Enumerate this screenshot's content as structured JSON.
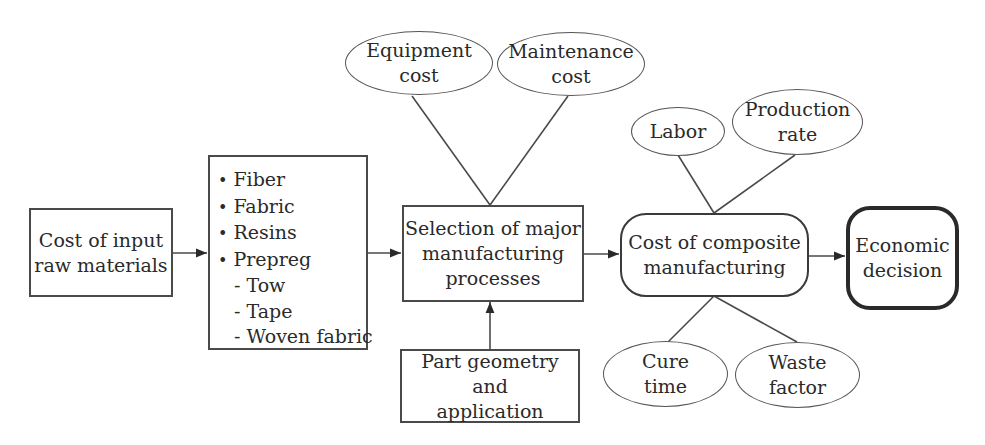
{
  "diagram": {
    "nodes": {
      "input_materials": {
        "lines": [
          "Cost of input",
          "raw materials"
        ]
      },
      "material_types": {
        "items": [
          {
            "label": "Fiber",
            "level": 1
          },
          {
            "label": "Fabric",
            "level": 1
          },
          {
            "label": "Resins",
            "level": 1
          },
          {
            "label": "Prepreg",
            "level": 1
          },
          {
            "label": "- Tow",
            "level": 2
          },
          {
            "label": "- Tape",
            "level": 2
          },
          {
            "label": "- Woven fabric",
            "level": 2
          }
        ]
      },
      "process_selection": {
        "lines": [
          "Selection of major",
          "manufacturing",
          "processes"
        ]
      },
      "equipment_cost": {
        "lines": [
          "Equipment",
          "cost"
        ]
      },
      "maintenance_cost": {
        "lines": [
          "Maintenance",
          "cost"
        ]
      },
      "part_geometry": {
        "lines": [
          "Part geometry and",
          "application"
        ]
      },
      "composite_cost": {
        "lines": [
          "Cost of composite",
          "manufacturing"
        ]
      },
      "labor": {
        "lines": [
          "Labor"
        ]
      },
      "production_rate": {
        "lines": [
          "Production",
          "rate"
        ]
      },
      "cure_time": {
        "lines": [
          "Cure",
          "time"
        ]
      },
      "waste_factor": {
        "lines": [
          "Waste",
          "factor"
        ]
      },
      "economic_decision": {
        "lines": [
          "Economic",
          "decision"
        ]
      }
    },
    "edges": [
      {
        "from": "input_materials",
        "to": "material_types",
        "type": "arrow"
      },
      {
        "from": "material_types",
        "to": "process_selection",
        "type": "arrow"
      },
      {
        "from": "equipment_cost",
        "to": "process_selection",
        "type": "line"
      },
      {
        "from": "maintenance_cost",
        "to": "process_selection",
        "type": "line"
      },
      {
        "from": "part_geometry",
        "to": "process_selection",
        "type": "arrow"
      },
      {
        "from": "process_selection",
        "to": "composite_cost",
        "type": "arrow"
      },
      {
        "from": "labor",
        "to": "composite_cost",
        "type": "line"
      },
      {
        "from": "production_rate",
        "to": "composite_cost",
        "type": "line"
      },
      {
        "from": "cure_time",
        "to": "composite_cost",
        "type": "line"
      },
      {
        "from": "waste_factor",
        "to": "composite_cost",
        "type": "line"
      },
      {
        "from": "composite_cost",
        "to": "economic_decision",
        "type": "arrow"
      }
    ],
    "colors": {
      "stroke": "#3a3a3a",
      "text": "#2a2a2a",
      "background": "#ffffff"
    }
  }
}
